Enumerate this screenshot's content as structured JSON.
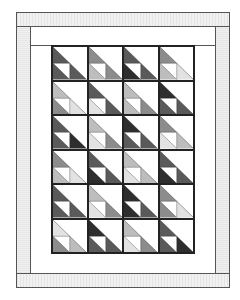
{
  "figure": {
    "title": ""
  },
  "colors": {
    "D": "#2e2e2e",
    "K": "#5a5a5a",
    "M": "#8c8c8c",
    "L": "#bdbdbd",
    "P": "#e2e2e2",
    "border_gray": "#ececec",
    "outline": "#444444"
  },
  "grid": {
    "columns": 4,
    "rows": 6,
    "blocks": [
      [
        [
          "K",
          "K",
          "K"
        ],
        [
          "M",
          "L",
          "M"
        ],
        [
          "K",
          "D",
          "K"
        ],
        [
          "M",
          "L",
          "P"
        ]
      ],
      [
        [
          "L",
          "M",
          "P"
        ],
        [
          "K",
          "P",
          "K"
        ],
        [
          "L",
          "L",
          "M"
        ],
        [
          "D",
          "K",
          "K"
        ]
      ],
      [
        [
          "K",
          "K",
          "D"
        ],
        [
          "L",
          "P",
          "M"
        ],
        [
          "D",
          "K",
          "K"
        ],
        [
          "M",
          "P",
          "L"
        ]
      ],
      [
        [
          "M",
          "L",
          "P"
        ],
        [
          "K",
          "D",
          "K"
        ],
        [
          "L",
          "P",
          "L"
        ],
        [
          "K",
          "D",
          "K"
        ]
      ],
      [
        [
          "K",
          "K",
          "K"
        ],
        [
          "L",
          "P",
          "M"
        ],
        [
          "D",
          "D",
          "K"
        ],
        [
          "M",
          "M",
          "P"
        ]
      ],
      [
        [
          "P",
          "M",
          "L"
        ],
        [
          "D",
          "K",
          "K"
        ],
        [
          "L",
          "P",
          "M"
        ],
        [
          "K",
          "K",
          "D"
        ]
      ]
    ]
  }
}
